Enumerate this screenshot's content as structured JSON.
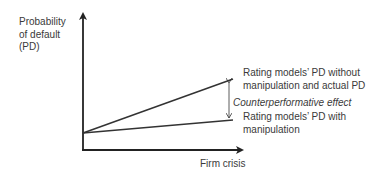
{
  "diagram": {
    "y_axis_label": [
      "Probability",
      "of default",
      "(PD)"
    ],
    "x_axis_label": "Firm crisis",
    "upper_line_label": [
      "Rating models’ PD without",
      "manipulation and actual PD"
    ],
    "gap_label": "Counterperformative effect",
    "lower_line_label": [
      "Rating models’ PD with",
      "manipulation"
    ],
    "colors": {
      "axis": "#222222",
      "line": "#333333",
      "text": "#3a3a3a"
    }
  }
}
